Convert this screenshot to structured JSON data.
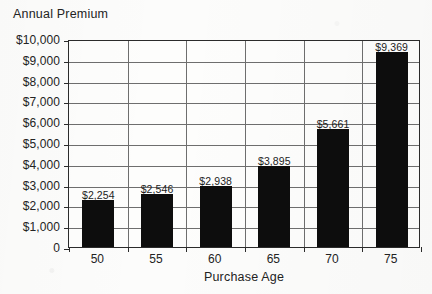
{
  "chart_data": {
    "type": "bar",
    "title": "Annual Premium",
    "xlabel": "Purchase Age",
    "ylabel": "Annual Premium",
    "categories": [
      "50",
      "55",
      "60",
      "65",
      "70",
      "75"
    ],
    "values": [
      2254,
      2546,
      2938,
      3895,
      5661,
      9369
    ],
    "value_labels": [
      "$2,254",
      "$2,546",
      "$2,938",
      "$3,895",
      "$5,661",
      "$9,369"
    ],
    "ylim": [
      0,
      10000
    ],
    "ytick_values": [
      0,
      1000,
      2000,
      3000,
      4000,
      5000,
      6000,
      7000,
      8000,
      9000,
      10000
    ],
    "ytick_labels": [
      "0",
      "$1,000",
      "$2,000",
      "$3,000",
      "$4,000",
      "$5,000",
      "$6,000",
      "$7,000",
      "$8,000",
      "$9,000",
      "$10,000"
    ],
    "grid": {
      "horizontal": true,
      "vertical": true,
      "color": "#6e6e6e"
    },
    "legend": null,
    "bar_color": "#0d0d0d",
    "axis_color": "#2b2b2b",
    "background_color": "#fdfdfc"
  }
}
